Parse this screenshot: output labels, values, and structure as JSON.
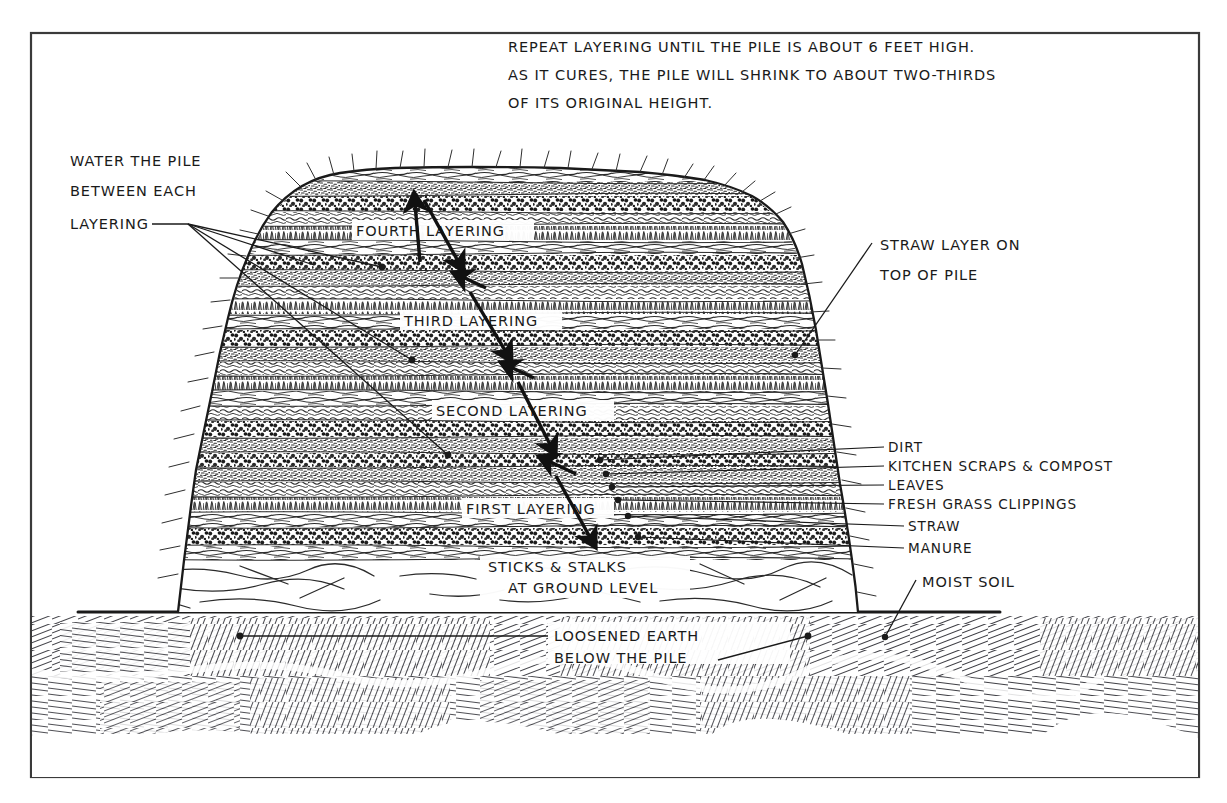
{
  "figure": {
    "ink_color": "#1a1a1a",
    "background_color": "#ffffff"
  },
  "header_note": {
    "line1": "REPEAT LAYERING UNTIL THE PILE IS ABOUT 6 FEET HIGH.",
    "line2": "AS IT CURES, THE PILE WILL SHRINK TO ABOUT TWO-THIRDS",
    "line3": "OF ITS ORIGINAL HEIGHT."
  },
  "left_note": {
    "line1": "WATER THE PILE",
    "line2": "BETWEEN EACH",
    "line3": "LAYERING"
  },
  "layering_labels": [
    {
      "id": "fourth",
      "label": "FOURTH LAYERING"
    },
    {
      "id": "third",
      "label": "THIRD LAYERING"
    },
    {
      "id": "second",
      "label": "SECOND LAYERING"
    },
    {
      "id": "first",
      "label": "FIRST LAYERING"
    }
  ],
  "right_notes": {
    "straw_top_line1": "STRAW LAYER ON",
    "straw_top_line2": "TOP OF PILE",
    "moist_soil": "MOIST SOIL"
  },
  "material_labels": [
    {
      "id": "dirt",
      "label": "DIRT"
    },
    {
      "id": "kitchen-scraps",
      "label": "KITCHEN SCRAPS & COMPOST"
    },
    {
      "id": "leaves",
      "label": "LEAVES"
    },
    {
      "id": "grass",
      "label": "FRESH GRASS CLIPPINGS"
    },
    {
      "id": "straw",
      "label": "STRAW"
    },
    {
      "id": "manure",
      "label": "MANURE"
    }
  ],
  "bottom_notes": {
    "sticks_line1": "STICKS & STALKS",
    "sticks_line2": "AT GROUND LEVEL",
    "earth_line1": "LOOSENED EARTH",
    "earth_line2": "BELOW THE PILE"
  }
}
